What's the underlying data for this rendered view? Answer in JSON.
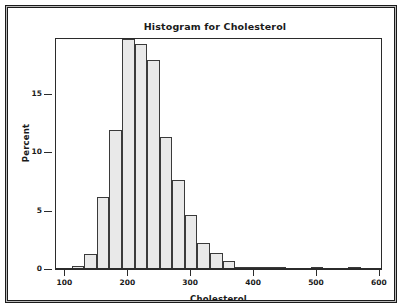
{
  "chart": {
    "title": "Histogram for Cholesterol",
    "xlabel": "Cholesterol",
    "ylabel": "Percent"
  },
  "chart_data": {
    "type": "bar",
    "title": "Histogram for Cholesterol",
    "xlabel": "Cholesterol",
    "ylabel": "Percent",
    "xlim": [
      85,
      605
    ],
    "ylim": [
      0,
      19.8
    ],
    "xticks": [
      100,
      200,
      300,
      400,
      500,
      600
    ],
    "yticks": [
      0,
      5,
      10,
      15
    ],
    "grid": false,
    "legend": null,
    "bin_width": 20,
    "bar_fill": "#e9e9e9",
    "bar_edge": "#3a3a3a",
    "bins": [
      {
        "start": 90,
        "end": 110,
        "center": 100,
        "value": 0.0
      },
      {
        "start": 110,
        "end": 130,
        "center": 120,
        "value": 0.25
      },
      {
        "start": 130,
        "end": 150,
        "center": 140,
        "value": 1.3
      },
      {
        "start": 150,
        "end": 170,
        "center": 160,
        "value": 6.2
      },
      {
        "start": 170,
        "end": 190,
        "center": 180,
        "value": 11.9
      },
      {
        "start": 190,
        "end": 210,
        "center": 200,
        "value": 19.7
      },
      {
        "start": 210,
        "end": 230,
        "center": 220,
        "value": 19.3
      },
      {
        "start": 230,
        "end": 250,
        "center": 240,
        "value": 17.9
      },
      {
        "start": 250,
        "end": 270,
        "center": 260,
        "value": 11.3
      },
      {
        "start": 270,
        "end": 290,
        "center": 280,
        "value": 7.6
      },
      {
        "start": 290,
        "end": 310,
        "center": 300,
        "value": 4.6
      },
      {
        "start": 310,
        "end": 330,
        "center": 320,
        "value": 2.2
      },
      {
        "start": 330,
        "end": 350,
        "center": 340,
        "value": 1.35
      },
      {
        "start": 350,
        "end": 370,
        "center": 360,
        "value": 0.65
      },
      {
        "start": 370,
        "end": 390,
        "center": 380,
        "value": 0.2
      },
      {
        "start": 390,
        "end": 410,
        "center": 400,
        "value": 0.1
      },
      {
        "start": 410,
        "end": 430,
        "center": 420,
        "value": 0.12
      },
      {
        "start": 430,
        "end": 450,
        "center": 440,
        "value": 0.05
      },
      {
        "start": 490,
        "end": 510,
        "center": 500,
        "value": 0.07
      },
      {
        "start": 550,
        "end": 570,
        "center": 560,
        "value": 0.05
      }
    ]
  }
}
